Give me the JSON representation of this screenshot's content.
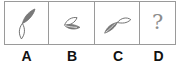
{
  "puzzle": {
    "options": [
      {
        "label": "A",
        "figure": "two-leaf-shapes-diagonal-up-right"
      },
      {
        "label": "B",
        "figure": "two-leaf-shapes-fan-left"
      },
      {
        "label": "C",
        "figure": "two-leaf-shapes-horizontal-right"
      },
      {
        "label": "D",
        "figure": "question-mark"
      }
    ],
    "unknown_symbol": "?"
  },
  "colors": {
    "border": "#9a9a9a",
    "figure_fill": "#7a7a7a",
    "figure_stroke": "#6e6e6e",
    "question_mark": "#8c8c8c",
    "label_text": "#111111"
  }
}
